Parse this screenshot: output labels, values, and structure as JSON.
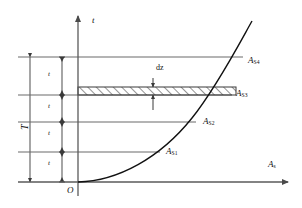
{
  "figure": {
    "type": "diagram",
    "title": "",
    "background_color": "#ffffff",
    "line_color": "#4a4a4a",
    "curve_color": "#111111",
    "text_color": "#111111"
  },
  "axes": {
    "vertical": {
      "label": "t",
      "label_icon": "t-axis-label",
      "x_px": 78,
      "top_px": 14,
      "bottom_px": 196,
      "arrow": "up"
    },
    "horizontal": {
      "label_base": "A",
      "label_sub": "s",
      "y_px": 182,
      "left_px": 18,
      "right_px": 292,
      "arrow": "right"
    },
    "origin": {
      "label": "O",
      "x_px": 68,
      "y_px": 191
    }
  },
  "curve": {
    "name": "saturation-curve",
    "description": "monotonically increasing convex curve from origin",
    "path": "M 78,182 C 120,180 168,152 200,110 C 222,80 240,44 252,22"
  },
  "level_lines": [
    {
      "id": "line-4",
      "y_px": 57,
      "x_start": 18,
      "x_end": 243,
      "label_base": "A",
      "label_sub": "S4",
      "label_x": 248,
      "label_y": 58
    },
    {
      "id": "line-3",
      "y_px": 95,
      "x_start": 18,
      "x_end": 232,
      "label_base": "A",
      "label_sub": "S3",
      "label_x": 236,
      "label_y": 92
    },
    {
      "id": "line-2",
      "y_px": 122,
      "x_start": 18,
      "x_end": 196,
      "label_base": "A",
      "label_sub": "S2",
      "label_x": 203,
      "label_y": 120
    },
    {
      "id": "line-1",
      "y_px": 152,
      "x_start": 18,
      "x_end": 160,
      "label_base": "A",
      "label_sub": "S1",
      "label_x": 166,
      "label_y": 150
    }
  ],
  "band": {
    "name": "hatched-strip",
    "top_px": 87,
    "bottom_px": 95,
    "left_px": 78,
    "right_px": 236,
    "hatch": "diagonal-45",
    "label": "dz",
    "label_x": 155,
    "label_y": 68,
    "dim_line_x": 153,
    "dim_top_y": 78,
    "dim_bottom_y": 110
  },
  "bracket": {
    "name": "total-time-bracket",
    "label": "T",
    "x_px": 30,
    "top_px": 57,
    "bottom_px": 182,
    "label_x": 22,
    "label_y": 126
  },
  "tick_column": {
    "name": "interval-tick-axis",
    "x_px": 62,
    "top_px": 57,
    "bottom_px": 182,
    "interval_label": "t",
    "intervals": [
      {
        "id": "interval-1",
        "label_x": 48,
        "label_y": 74,
        "tick_y": 57
      },
      {
        "id": "interval-2",
        "label_x": 48,
        "label_y": 106,
        "tick_y": 95
      },
      {
        "id": "interval-3",
        "label_x": 48,
        "label_y": 133,
        "tick_y": 122
      },
      {
        "id": "interval-4",
        "label_x": 48,
        "label_y": 163,
        "tick_y": 152
      }
    ]
  }
}
